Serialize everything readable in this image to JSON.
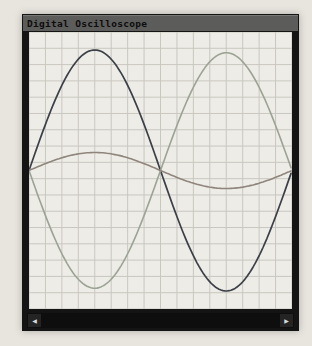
{
  "window": {
    "title": "Digital Oscilloscope"
  },
  "scrollbar": {
    "left_arrow": "◀",
    "right_arrow": "▶"
  },
  "colors": {
    "page_bg": "#e8e5df",
    "titlebar_bg": "#5c5c5a",
    "titlebar_text": "#0d0d0d",
    "window_frame": "#141414",
    "plot_bg": "#edece6",
    "grid_line": "#c9c7c0",
    "scrollbar_bg": "#0e0e0e",
    "scrollbar_arrow": "#d8d8d8"
  },
  "chart_data": {
    "type": "line",
    "title": "Digital Oscilloscope",
    "xlabel": "",
    "ylabel": "",
    "x_range": [
      0,
      1
    ],
    "y_range": [
      -1,
      1
    ],
    "grid": true,
    "grid_cols": 16,
    "grid_rows": 17,
    "legend": "none",
    "series": [
      {
        "name": "channel-dark",
        "shape": "sine",
        "color": "#3b3f47",
        "amplitude": 0.87,
        "period": 1,
        "phase": 0,
        "stroke_width": 1.7
      },
      {
        "name": "channel-green",
        "shape": "sine",
        "color": "#9ba394",
        "amplitude": 0.85,
        "period": 1,
        "phase": 0.5,
        "stroke_width": 1.6
      },
      {
        "name": "channel-red",
        "shape": "sine",
        "color": "#8f857c",
        "amplitude": 0.13,
        "period": 1,
        "phase": 0,
        "stroke_width": 1.6
      }
    ]
  }
}
